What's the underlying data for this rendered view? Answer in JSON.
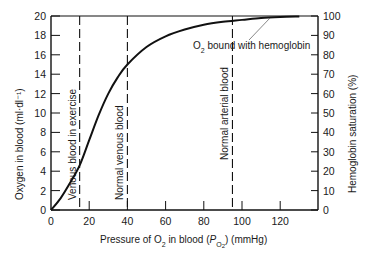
{
  "chart_data": {
    "type": "line",
    "title": "",
    "xlabel": "Pressure of O2 in blood (PO2) (mmHg)",
    "xlabel_parts": {
      "pre": "Pressure of O",
      "sub1": "2",
      "mid": " in blood (",
      "p": "P",
      "sub2": "O",
      "sub3": "2",
      "post": ") (mmHg)"
    },
    "ylabel": "Oxygen in blood (ml·dl⁻¹)",
    "y2label": "Hemoglobin saturation (%)",
    "xlim": [
      0,
      140
    ],
    "ylim": [
      0,
      20
    ],
    "y2lim": [
      0,
      100
    ],
    "xticks": [
      0,
      20,
      40,
      60,
      80,
      100,
      120
    ],
    "yticks": [
      0,
      2,
      4,
      6,
      8,
      10,
      12,
      14,
      16,
      18,
      20
    ],
    "y2ticks": [
      0,
      10,
      20,
      30,
      40,
      50,
      60,
      70,
      80,
      90,
      100
    ],
    "grid": false,
    "series": [
      {
        "name": "O2 bound with hemoglobin",
        "x": [
          0,
          5,
          10,
          15,
          20,
          25,
          30,
          35,
          40,
          50,
          60,
          70,
          80,
          90,
          100,
          110,
          120,
          130
        ],
        "values": [
          0,
          1.2,
          2.8,
          4.6,
          7.2,
          9.8,
          12.0,
          13.7,
          15.0,
          16.8,
          17.9,
          18.6,
          19.1,
          19.4,
          19.6,
          19.8,
          19.9,
          19.95
        ]
      }
    ],
    "reference_lines": [
      {
        "x": 15,
        "label": "Venous blood in exercise"
      },
      {
        "x": 40,
        "label": "Normal venous blood"
      },
      {
        "x": 95,
        "label": "Normal arterial blood"
      }
    ],
    "annotations": [
      {
        "text": "O2 bound with hemoglobin",
        "pre": "O",
        "sub": "2",
        "post": " bound with hemoglobin",
        "points_to_x": 120
      }
    ]
  }
}
